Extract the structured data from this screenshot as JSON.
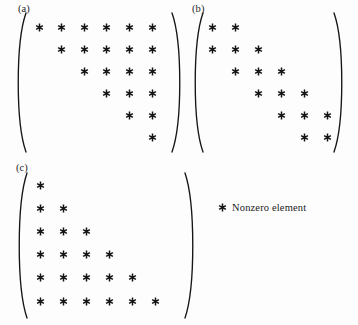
{
  "figure": {
    "background_color": "#fdfdfd",
    "ink_color": "#131313",
    "marker_glyph": "asterisk",
    "marker_name": "nonzero-element-marker"
  },
  "legend": {
    "marker": "*",
    "label": "Nonzero element",
    "x": 218,
    "y": 202
  },
  "panels": [
    {
      "id": "a",
      "label": "(a)",
      "label_x": 18,
      "label_y": 3,
      "pattern_name": "upper-triangular",
      "rows": 6,
      "cols": 6,
      "origin_x": 39,
      "origin_y": 27,
      "col_step": 22.6,
      "row_step": 22.0,
      "bracket_left": {
        "x": 26,
        "y_top": 13,
        "y_bottom": 152,
        "bulge": 9
      },
      "bracket_right": {
        "x": 172,
        "y_top": 13,
        "y_bottom": 152,
        "bulge": 9
      },
      "cells": [
        [
          1,
          1,
          1,
          1,
          1,
          1
        ],
        [
          0,
          1,
          1,
          1,
          1,
          1
        ],
        [
          0,
          0,
          1,
          1,
          1,
          1
        ],
        [
          0,
          0,
          0,
          1,
          1,
          1
        ],
        [
          0,
          0,
          0,
          0,
          1,
          1
        ],
        [
          0,
          0,
          0,
          0,
          0,
          1
        ]
      ]
    },
    {
      "id": "b",
      "label": "(b)",
      "label_x": 192,
      "label_y": 3,
      "pattern_name": "tridiagonal-banded",
      "rows": 6,
      "cols": 6,
      "origin_x": 212,
      "origin_y": 27,
      "col_step": 23.0,
      "row_step": 22.0,
      "bracket_left": {
        "x": 203,
        "y_top": 13,
        "y_bottom": 152,
        "bulge": 9
      },
      "bracket_right": {
        "x": 334,
        "y_top": 13,
        "y_bottom": 152,
        "bulge": 9
      },
      "cells": [
        [
          1,
          1,
          0,
          0,
          0,
          0
        ],
        [
          1,
          1,
          1,
          0,
          0,
          0
        ],
        [
          0,
          1,
          1,
          1,
          0,
          0
        ],
        [
          0,
          0,
          1,
          1,
          1,
          0
        ],
        [
          0,
          0,
          0,
          1,
          1,
          1
        ],
        [
          0,
          0,
          0,
          0,
          1,
          1
        ]
      ]
    },
    {
      "id": "c",
      "label": "(c)",
      "label_x": 16,
      "label_y": 162,
      "pattern_name": "lower-triangular",
      "rows": 6,
      "cols": 6,
      "origin_x": 40,
      "origin_y": 185,
      "col_step": 23.0,
      "row_step": 23.2,
      "bracket_left": {
        "x": 27,
        "y_top": 173,
        "y_bottom": 318,
        "bulge": 9
      },
      "bracket_right": {
        "x": 185,
        "y_top": 173,
        "y_bottom": 318,
        "bulge": 9
      },
      "cells": [
        [
          1,
          0,
          0,
          0,
          0,
          0
        ],
        [
          1,
          1,
          0,
          0,
          0,
          0
        ],
        [
          1,
          1,
          1,
          0,
          0,
          0
        ],
        [
          1,
          1,
          1,
          1,
          0,
          0
        ],
        [
          1,
          1,
          1,
          1,
          1,
          0
        ],
        [
          1,
          1,
          1,
          1,
          1,
          1
        ]
      ]
    }
  ]
}
